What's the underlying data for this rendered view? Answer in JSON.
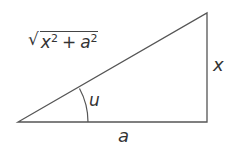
{
  "diagram": {
    "type": "right-triangle",
    "stroke_color": "#555555",
    "vertices": {
      "left": [
        18,
        122
      ],
      "right_bottom": [
        207,
        122
      ],
      "right_top": [
        207,
        13
      ]
    },
    "angle_arc": {
      "radius": 70
    },
    "labels": {
      "hypotenuse": {
        "radical": "√",
        "term1_base": "x",
        "term1_exp": "2",
        "operator": "+",
        "term2_base": "a",
        "term2_exp": "2"
      },
      "opposite_side": "x",
      "adjacent_side": "a",
      "angle": "u"
    }
  }
}
